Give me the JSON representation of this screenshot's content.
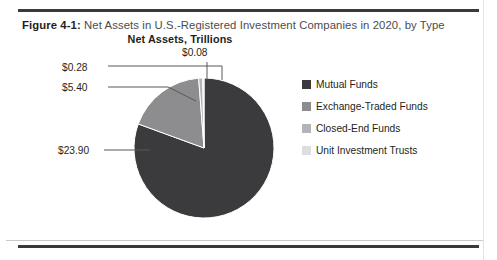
{
  "figure": {
    "caption_lead": "Figure 4-1:",
    "caption_text": " Net Assets in U.S.-Registered Investment Companies in 2020, by Type"
  },
  "chart_data": {
    "type": "pie",
    "title": "Net Assets, Trillions",
    "subtitle": "",
    "xlabel": "",
    "ylabel": "",
    "unit": "Trillions USD",
    "legend_position": "right",
    "grid": false,
    "categories": [
      "Mutual Funds",
      "Exchange-Traded Funds",
      "Closed-End Funds",
      "Unit Investment Trusts"
    ],
    "values": [
      23.9,
      5.4,
      0.28,
      0.08
    ],
    "value_labels": [
      "$23.90",
      "$5.40",
      "$0.28",
      "$0.08"
    ],
    "colors": [
      "#3b3b3d",
      "#8d8d90",
      "#b4b4b7",
      "#dedee0"
    ],
    "total": 29.66,
    "slices": [
      {
        "label": "Mutual Funds",
        "value": 23.9,
        "value_label": "$23.90",
        "color": "#3b3b3d",
        "percent": 80.6
      },
      {
        "label": "Exchange-Traded Funds",
        "value": 5.4,
        "value_label": "$5.40",
        "color": "#8d8d90",
        "percent": 18.2
      },
      {
        "label": "Closed-End Funds",
        "value": 0.28,
        "value_label": "$0.28",
        "color": "#b4b4b7",
        "percent": 0.9
      },
      {
        "label": "Unit Investment Trusts",
        "value": 0.08,
        "value_label": "$0.08",
        "color": "#dedee0",
        "percent": 0.3
      }
    ]
  },
  "legend": {
    "items": [
      {
        "label": "Mutual Funds",
        "color": "#3b3b3d"
      },
      {
        "label": "Exchange-Traded Funds",
        "color": "#8d8d90"
      },
      {
        "label": "Closed-End Funds",
        "color": "#b4b4b7"
      },
      {
        "label": "Unit Investment Trusts",
        "color": "#dedee0"
      }
    ]
  }
}
